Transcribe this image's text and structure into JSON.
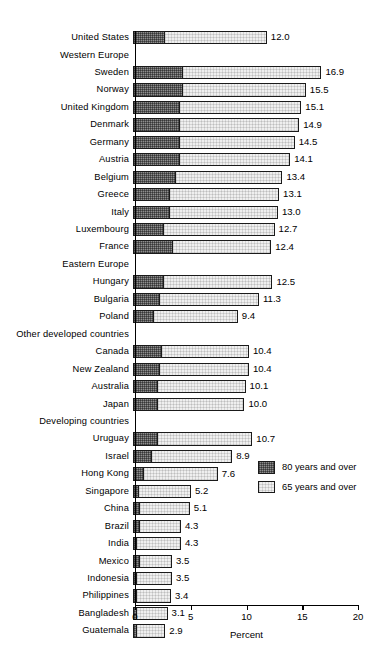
{
  "chart_data": {
    "type": "bar",
    "orientation": "horizontal",
    "stacked": true,
    "title": "",
    "xlabel": "Percent",
    "ylabel": "",
    "xlim": [
      0,
      20
    ],
    "xticks": [
      "0",
      "5",
      "10",
      "15",
      "20"
    ],
    "grid": false,
    "legend_position": "inside-right",
    "series": [
      {
        "name": "80 years and over",
        "key": "v80"
      },
      {
        "name": "65 years and over",
        "key": "v65"
      }
    ],
    "rows": [
      {
        "label": "United States",
        "group": false,
        "total": "12.0",
        "v65": 12.0,
        "v80": 2.9
      },
      {
        "label": "Western Europe",
        "group": true,
        "total": "",
        "v65": null,
        "v80": null
      },
      {
        "label": "Sweden",
        "group": false,
        "total": "16.9",
        "v65": 16.9,
        "v80": 4.5
      },
      {
        "label": "Norway",
        "group": false,
        "total": "15.5",
        "v65": 15.5,
        "v80": 4.5
      },
      {
        "label": "United Kingdom",
        "group": false,
        "total": "15.1",
        "v65": 15.1,
        "v80": 4.2
      },
      {
        "label": "Denmark",
        "group": false,
        "total": "14.9",
        "v65": 14.9,
        "v80": 4.2
      },
      {
        "label": "Germany",
        "group": false,
        "total": "14.5",
        "v65": 14.5,
        "v80": 4.2
      },
      {
        "label": "Austria",
        "group": false,
        "total": "14.1",
        "v65": 14.1,
        "v80": 4.2
      },
      {
        "label": "Belgium",
        "group": false,
        "total": "13.4",
        "v65": 13.4,
        "v80": 3.9
      },
      {
        "label": "Greece",
        "group": false,
        "total": "13.1",
        "v65": 13.1,
        "v80": 3.3
      },
      {
        "label": "Italy",
        "group": false,
        "total": "13.0",
        "v65": 13.0,
        "v80": 3.3
      },
      {
        "label": "Luxembourg",
        "group": false,
        "total": "12.7",
        "v65": 12.7,
        "v80": 2.8
      },
      {
        "label": "France",
        "group": false,
        "total": "12.4",
        "v65": 12.4,
        "v80": 3.6
      },
      {
        "label": "Eastern Europe",
        "group": true,
        "total": "",
        "v65": null,
        "v80": null
      },
      {
        "label": "Hungary",
        "group": false,
        "total": "12.5",
        "v65": 12.5,
        "v80": 2.8
      },
      {
        "label": "Bulgaria",
        "group": false,
        "total": "11.3",
        "v65": 11.3,
        "v80": 2.4
      },
      {
        "label": "Poland",
        "group": false,
        "total": "9.4",
        "v65": 9.4,
        "v80": 1.9
      },
      {
        "label": "Other developed countries",
        "group": true,
        "total": "",
        "v65": null,
        "v80": null
      },
      {
        "label": "Canada",
        "group": false,
        "total": "10.4",
        "v65": 10.4,
        "v80": 2.6
      },
      {
        "label": "New Zealand",
        "group": false,
        "total": "10.4",
        "v65": 10.4,
        "v80": 2.4
      },
      {
        "label": "Australia",
        "group": false,
        "total": "10.1",
        "v65": 10.1,
        "v80": 2.2
      },
      {
        "label": "Japan",
        "group": false,
        "total": "10.0",
        "v65": 10.0,
        "v80": 2.2
      },
      {
        "label": "Developing countries",
        "group": true,
        "total": "",
        "v65": null,
        "v80": null
      },
      {
        "label": "Uruguay",
        "group": false,
        "total": "10.7",
        "v65": 10.7,
        "v80": 2.2
      },
      {
        "label": "Israel",
        "group": false,
        "total": "8.9",
        "v65": 8.9,
        "v80": 1.7
      },
      {
        "label": "Hong Kong",
        "group": false,
        "total": "7.6",
        "v65": 7.6,
        "v80": 1.0
      },
      {
        "label": "Singapore",
        "group": false,
        "total": "5.2",
        "v65": 5.2,
        "v80": 0.5
      },
      {
        "label": "China",
        "group": false,
        "total": "5.1",
        "v65": 5.1,
        "v80": 0.6
      },
      {
        "label": "Brazil",
        "group": false,
        "total": "4.3",
        "v65": 4.3,
        "v80": 0.6
      },
      {
        "label": "India",
        "group": false,
        "total": "4.3",
        "v65": 4.3,
        "v80": 0.4
      },
      {
        "label": "Mexico",
        "group": false,
        "total": "3.5",
        "v65": 3.5,
        "v80": 0.6
      },
      {
        "label": "Indonesia",
        "group": false,
        "total": "3.5",
        "v65": 3.5,
        "v80": 0.4
      },
      {
        "label": "Philippines",
        "group": false,
        "total": "3.4",
        "v65": 3.4,
        "v80": 0.4
      },
      {
        "label": "Bangladesh",
        "group": false,
        "total": "3.1",
        "v65": 3.1,
        "v80": 0.4
      },
      {
        "label": "Guatemala",
        "group": false,
        "total": "2.9",
        "v65": 2.9,
        "v80": 0.4
      }
    ]
  },
  "legend": {
    "items": [
      {
        "label": "80 years and over",
        "swatch": "dark-checkered"
      },
      {
        "label": "65 years and over",
        "swatch": "light-stipple"
      }
    ]
  },
  "axis": {
    "x_title": "Percent",
    "ticks": [
      "0",
      "5",
      "10",
      "15",
      "20"
    ]
  },
  "colors": {
    "bar_80": "#8e8e8e",
    "bar_65": "#efefef",
    "outline": "#1a1a1a",
    "background": "#ffffff",
    "text": "#000000"
  }
}
